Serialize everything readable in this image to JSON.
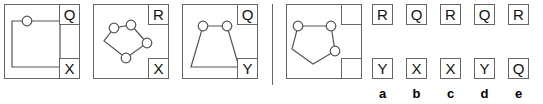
{
  "puzzle": {
    "type": "visual-analogy-multiple-choice",
    "sequence": [
      {
        "name": "panel-1",
        "shape": "square-with-one-node",
        "top_right_label": "Q",
        "bottom_right_label": "X",
        "node_count": 1
      },
      {
        "name": "panel-2",
        "shape": "pentagon-with-four-nodes",
        "top_right_label": "R",
        "bottom_right_label": "X",
        "node_count": 4
      },
      {
        "name": "panel-3",
        "shape": "trapezoid-with-two-nodes",
        "top_right_label": "Q",
        "bottom_right_label": "Y",
        "node_count": 2
      },
      {
        "name": "panel-4-question",
        "shape": "pentagon-with-three-nodes",
        "top_right_label": "",
        "bottom_right_label": "",
        "node_count": 3
      }
    ],
    "options": [
      {
        "letter": "a",
        "top": "R",
        "bottom": "Y"
      },
      {
        "letter": "b",
        "top": "Q",
        "bottom": "X"
      },
      {
        "letter": "c",
        "top": "R",
        "bottom": "X"
      },
      {
        "letter": "d",
        "top": "Q",
        "bottom": "Y"
      },
      {
        "letter": "e",
        "top": "R",
        "bottom": "Q"
      }
    ]
  },
  "colors": {
    "stroke": "#666666",
    "figure_stroke": "#555555",
    "text": "#111111",
    "background": "#ffffff"
  }
}
